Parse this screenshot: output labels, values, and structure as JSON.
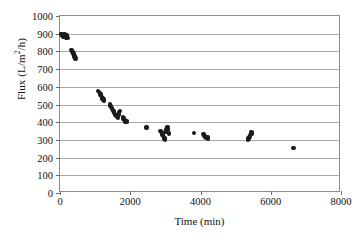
{
  "chart_data": {
    "type": "scatter",
    "title": "",
    "xlabel": "Time (min)",
    "ylabel": "Flux (L/m2/h)",
    "ylabel_parts": {
      "prefix": "Flux (L/m",
      "sup": "2",
      "suffix": "/h)"
    },
    "xlim": [
      0,
      8000
    ],
    "ylim": [
      0,
      1000
    ],
    "xticks": [
      0,
      2000,
      4000,
      6000,
      8000
    ],
    "yticks": [
      0,
      100,
      200,
      300,
      400,
      500,
      600,
      700,
      800,
      900,
      1000
    ],
    "xtick_labels": [
      "0",
      "2000",
      "4000",
      "6000",
      "8000"
    ],
    "ytick_labels": [
      "0",
      "100",
      "200",
      "300",
      "400",
      "500",
      "600",
      "700",
      "800",
      "900",
      "1000"
    ],
    "grid": "horizontal",
    "legend": "none",
    "marker_color": "#1b1b1b",
    "gridline_color": "#a8a8a8",
    "frame_color": "#8d8d8d",
    "series": [
      {
        "name": "Flux vs Time",
        "points": [
          [
            30,
            900
          ],
          [
            45,
            897
          ],
          [
            60,
            893
          ],
          [
            75,
            888
          ],
          [
            95,
            884
          ],
          [
            110,
            880
          ],
          [
            130,
            895
          ],
          [
            150,
            886
          ],
          [
            165,
            878
          ],
          [
            180,
            890
          ],
          [
            200,
            882
          ],
          [
            215,
            875
          ],
          [
            330,
            808
          ],
          [
            350,
            800
          ],
          [
            365,
            795
          ],
          [
            385,
            788
          ],
          [
            400,
            780
          ],
          [
            415,
            772
          ],
          [
            430,
            765
          ],
          [
            445,
            760
          ],
          [
            1090,
            578
          ],
          [
            1110,
            570
          ],
          [
            1130,
            562
          ],
          [
            1150,
            556
          ],
          [
            1170,
            548
          ],
          [
            1195,
            540
          ],
          [
            1215,
            533
          ],
          [
            1235,
            528
          ],
          [
            1255,
            522
          ],
          [
            1420,
            500
          ],
          [
            1440,
            493
          ],
          [
            1460,
            486
          ],
          [
            1480,
            478
          ],
          [
            1500,
            470
          ],
          [
            1520,
            462
          ],
          [
            1545,
            455
          ],
          [
            1565,
            448
          ],
          [
            1585,
            442
          ],
          [
            1605,
            436
          ],
          [
            1625,
            430
          ],
          [
            1645,
            424
          ],
          [
            1665,
            440
          ],
          [
            1685,
            455
          ],
          [
            1700,
            462
          ],
          [
            1790,
            428
          ],
          [
            1810,
            422
          ],
          [
            1830,
            416
          ],
          [
            1850,
            410
          ],
          [
            1870,
            405
          ],
          [
            1890,
            400
          ],
          [
            1910,
            408
          ],
          [
            2460,
            370
          ],
          [
            2860,
            350
          ],
          [
            2880,
            343
          ],
          [
            2900,
            336
          ],
          [
            2920,
            330
          ],
          [
            2940,
            322
          ],
          [
            2960,
            315
          ],
          [
            2975,
            308
          ],
          [
            2990,
            302
          ],
          [
            3005,
            345
          ],
          [
            3020,
            352
          ],
          [
            3035,
            360
          ],
          [
            3050,
            368
          ],
          [
            3065,
            372
          ],
          [
            3080,
            358
          ],
          [
            3095,
            340
          ],
          [
            3110,
            332
          ],
          [
            3810,
            338
          ],
          [
            4080,
            332
          ],
          [
            4100,
            326
          ],
          [
            4120,
            320
          ],
          [
            4140,
            316
          ],
          [
            4160,
            312
          ],
          [
            4180,
            318
          ],
          [
            4200,
            314
          ],
          [
            4220,
            308
          ],
          [
            5350,
            300
          ],
          [
            5370,
            308
          ],
          [
            5390,
            318
          ],
          [
            5410,
            328
          ],
          [
            5430,
            336
          ],
          [
            5450,
            342
          ],
          [
            5470,
            334
          ],
          [
            6650,
            255
          ]
        ]
      }
    ]
  }
}
